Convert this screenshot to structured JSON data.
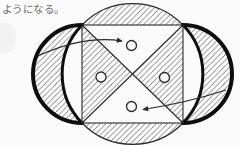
{
  "caption": {
    "text": "ようになる。"
  },
  "figure": {
    "type": "geometry-diagram",
    "colors": {
      "paper": "#fbfbfb",
      "line": "#2a2a2a",
      "thick": "#0d0d0d",
      "hatch": "#6a6a6a",
      "text": "#6b6b6b"
    },
    "elements": {
      "hatched_regions": [
        "top-segment",
        "bottom-segment",
        "left-lune",
        "right-lune",
        "left-triangle",
        "right-triangle"
      ],
      "white_regions": [
        "top-triangle",
        "bottom-triangle",
        "left-side-segment",
        "right-side-segment"
      ],
      "point_markers": 4,
      "arrows": [
        {
          "from": "left-lune",
          "to": "top-triangle"
        },
        {
          "from": "right-lune",
          "to": "bottom-triangle"
        }
      ]
    }
  }
}
